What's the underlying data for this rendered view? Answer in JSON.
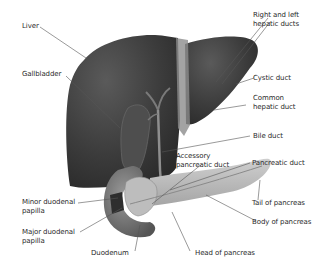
{
  "diagram": {
    "colors": {
      "liver": "#3a3a3a",
      "liver_highlight": "#5c5c5c",
      "gallbladder": "#4a4a4a",
      "duct": "#8a8a8a",
      "pancreas": "#b8b8b8",
      "duodenum": "#6e6e6e",
      "leader_line": "#555555",
      "text": "#2a2a2a"
    },
    "labels": {
      "liver": [
        "Liver"
      ],
      "gallbladder": [
        "Gallbladder"
      ],
      "hepatic_ducts": [
        "Right and left",
        "hepatic ducts"
      ],
      "cystic_duct": [
        "Cystic duct"
      ],
      "common_hepatic_duct": [
        "Common",
        "hepatic duct"
      ],
      "bile_duct": [
        "Bile duct"
      ],
      "accessory_pancreatic_duct": [
        "Accessory",
        "pancreatic duct"
      ],
      "pancreatic_duct": [
        "Pancreatic duct"
      ],
      "tail_of_pancreas": [
        "Tail of pancreas"
      ],
      "body_of_pancreas": [
        "Body of pancreas"
      ],
      "minor_duodenal_papilla": [
        "Minor duodenal",
        "papilla"
      ],
      "major_duodenal_papilla": [
        "Major duodenal",
        "papilla"
      ],
      "duodenum": [
        "Duodenum"
      ],
      "head_of_pancreas": [
        "Head of pancreas"
      ]
    }
  }
}
